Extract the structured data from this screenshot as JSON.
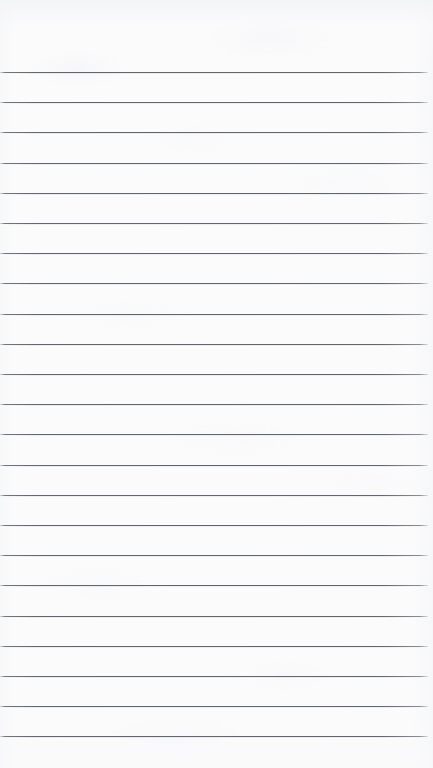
{
  "document": {
    "kind": "lined-notebook-paper",
    "title": "Blank ruled notebook page",
    "orientation": "portrait",
    "width_px": 433,
    "height_px": 768,
    "content_text": "",
    "has_handwriting": false,
    "has_margin_rule": false,
    "has_header_text": false,
    "has_page_number": false
  },
  "paper": {
    "background_color": "#fbfbfc",
    "edge_tint_color": "#f3f4f6",
    "texture": "faint mottled scan grain"
  },
  "ruling": {
    "line_color": "#606a72",
    "line_thickness_px": 1,
    "line_count": 23,
    "line_spacing_px": 30.2,
    "first_line_y_px": 72,
    "last_line_y_px": 736,
    "line_start_x_px": 0,
    "line_end_x_px": 428,
    "top_margin_px": 72,
    "bottom_margin_px": 32,
    "line_y_positions": [
      72,
      102.2,
      132.4,
      162.6,
      192.8,
      223,
      253.2,
      283.4,
      313.6,
      343.8,
      374,
      404.2,
      434.4,
      464.6,
      494.8,
      525,
      555.2,
      585.4,
      615.6,
      645.8,
      676,
      706.2,
      736.4
    ]
  }
}
